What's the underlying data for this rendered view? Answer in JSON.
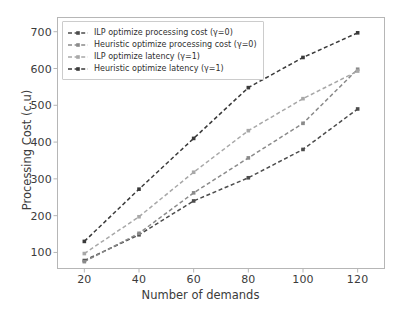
{
  "chart_data": {
    "type": "line",
    "title": "",
    "xlabel": "Number of demands",
    "ylabel": "Processing Cost (c.u)",
    "x": [
      20,
      40,
      60,
      80,
      100,
      120
    ],
    "xticks": [
      "20",
      "40",
      "60",
      "80",
      "100",
      "120"
    ],
    "yticks": [
      "100",
      "200",
      "300",
      "400",
      "500",
      "600",
      "700"
    ],
    "xlim": [
      10,
      130
    ],
    "ylim": [
      55,
      740
    ],
    "grid": false,
    "legend_position": "upper-left",
    "linestyle": "dashed",
    "marker": "square",
    "series": [
      {
        "name": "ILP optimize processing cost (γ=0)",
        "color": "#4c4c4c",
        "values": [
          78,
          148,
          240,
          303,
          380,
          490
        ]
      },
      {
        "name": "Heuristic optimize processing cost (γ=0)",
        "color": "#8a8a8a",
        "values": [
          75,
          152,
          262,
          357,
          451,
          598
        ]
      },
      {
        "name": "ILP optimize latency (γ=1)",
        "color": "#a8a8a8",
        "values": [
          97,
          197,
          318,
          431,
          518,
          593
        ]
      },
      {
        "name": "Heuristic optimize latency (γ=1)",
        "color": "#3a3a3a",
        "values": [
          130,
          272,
          410,
          548,
          630,
          697
        ]
      }
    ]
  },
  "legend": {
    "items": [
      "ILP optimize processing cost (γ=0)",
      "Heuristic optimize processing cost (γ=0)",
      "ILP optimize latency (γ=1)",
      "Heuristic optimize latency (γ=1)"
    ]
  },
  "axes": {
    "x_label": "Number of demands",
    "y_label": "Processing Cost (c.u)",
    "x_ticks": [
      "20",
      "40",
      "60",
      "80",
      "100",
      "120"
    ],
    "y_ticks": [
      "700",
      "600",
      "500",
      "400",
      "300",
      "200",
      "100"
    ]
  }
}
